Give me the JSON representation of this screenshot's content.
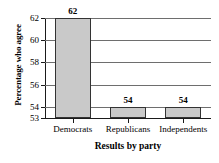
{
  "chart_data": {
    "type": "bar",
    "title": "",
    "subtitle": "",
    "categories": [
      "Democrats",
      "Republicans",
      "Independents"
    ],
    "values": [
      62,
      54,
      54
    ],
    "data_labels": [
      "62",
      "54",
      "54"
    ],
    "xlabel": "Results by party",
    "ylabel": "Percentage who agree",
    "ylim": [
      53,
      62
    ],
    "yticks": [
      53,
      54,
      56,
      58,
      60,
      62
    ],
    "ytick_labels": [
      "53",
      "54",
      "56",
      "58",
      "60",
      "62"
    ],
    "gridlines": "horizontal",
    "legend": "none",
    "bar_fill_color": "#c9c9c9",
    "bar_border_color": "#333333",
    "gridline_color": "#6e6e6e",
    "axis_color": "#1a1a1a",
    "background_color": "#ffffff"
  }
}
